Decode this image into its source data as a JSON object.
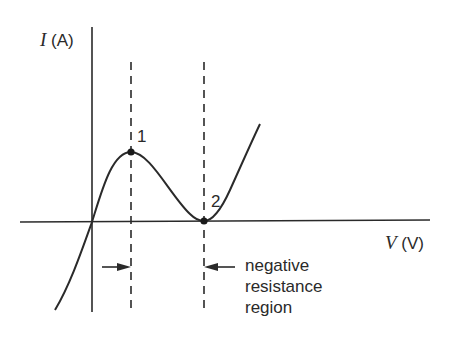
{
  "diagram": {
    "type": "I-V characteristic curve",
    "y_axis": {
      "symbol": "I",
      "unit": "(A)"
    },
    "x_axis": {
      "symbol": "V",
      "unit": "(V)"
    },
    "points": [
      {
        "label": "1",
        "description": "peak"
      },
      {
        "label": "2",
        "description": "valley"
      }
    ],
    "annotation": {
      "lines": [
        "negative",
        "resistance",
        "region"
      ]
    },
    "colors": {
      "stroke": "#2a2a2a",
      "background": "#ffffff"
    }
  }
}
